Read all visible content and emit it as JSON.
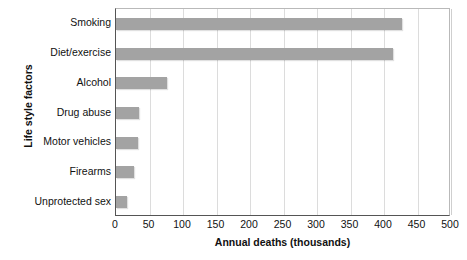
{
  "chart_data": {
    "type": "bar",
    "orientation": "horizontal",
    "title": "",
    "xlabel": "Annual deaths (thousands)",
    "ylabel": "Life style factors",
    "categories": [
      "Smoking",
      "Diet/exercise",
      "Alcohol",
      "Drug abuse",
      "Motor vehicles",
      "Firearms",
      "Unprotected sex"
    ],
    "values": [
      427,
      413,
      76,
      34,
      33,
      27,
      16
    ],
    "xlim": [
      0,
      500
    ],
    "xticks": [
      0,
      50,
      100,
      150,
      200,
      250,
      300,
      350,
      400,
      450,
      500
    ],
    "xtick_labels": [
      "0",
      "50",
      "100",
      "150",
      "200",
      "250",
      "300",
      "350",
      "400",
      "450",
      "500"
    ],
    "grid": "vertical",
    "legend": "none",
    "bar_color": "#a3a3a3",
    "grid_color": "#dcdcdc",
    "axis_color": "#555555",
    "background": "#ffffff"
  }
}
